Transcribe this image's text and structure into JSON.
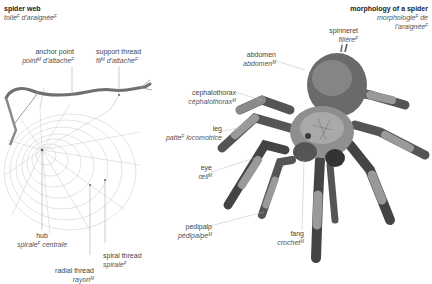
{
  "web_section": {
    "title": {
      "en": "spider web",
      "fr": "toile",
      "fr_gender": "F",
      "fr_suffix": " d'araignée",
      "fr_suffix_gender": "F"
    },
    "labels": [
      {
        "id": "anchor-point",
        "en": "anchor point",
        "fr": "point",
        "g1": "M",
        "fr2": " d'attache",
        "g2": "F"
      },
      {
        "id": "support-thread",
        "en": "support thread",
        "fr": "fil",
        "g1": "M",
        "fr2": " d'attache",
        "g2": "F"
      },
      {
        "id": "hub",
        "en": "hub",
        "fr": "spirale",
        "g1": "F",
        "fr2": " centrale",
        "g2": ""
      },
      {
        "id": "spiral-thread",
        "en": "spiral thread",
        "fr": "spirale",
        "g1": "F",
        "fr2": "",
        "g2": ""
      },
      {
        "id": "radial-thread",
        "en": "radial thread",
        "fr": "rayon",
        "g1": "M",
        "fr2": "",
        "g2": ""
      }
    ]
  },
  "spider_section": {
    "title": {
      "en": "morphology of a spider",
      "fr": "morphologie",
      "fr_gender": "F",
      "fr_suffix": " de",
      "fr_line3": "l'araignée",
      "fr_line3_gender": "F"
    },
    "labels": [
      {
        "id": "spinneret",
        "en": "spinneret",
        "fr": "filière",
        "g1": "F"
      },
      {
        "id": "abdomen",
        "en": "abdomen",
        "fr": "abdomen",
        "g1": "M"
      },
      {
        "id": "cephalothorax",
        "en": "cephalothorax",
        "fr": "céphalothorax",
        "g1": "M"
      },
      {
        "id": "leg",
        "en": "leg",
        "fr": "patte",
        "g1": "F",
        "fr2": " locomotrice"
      },
      {
        "id": "eye",
        "en": "eye",
        "fr": "œil",
        "g1": "M"
      },
      {
        "id": "pedipalp",
        "en": "pedipalp",
        "fr": "pédipalpe",
        "g1": "M"
      },
      {
        "id": "fang",
        "en": "fang",
        "fr": "crochet",
        "g1": "M"
      }
    ]
  }
}
